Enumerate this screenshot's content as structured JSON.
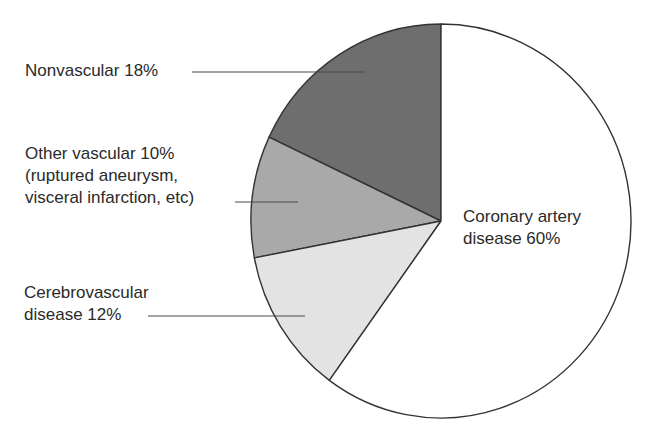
{
  "chart_data": {
    "type": "pie",
    "title": "",
    "start_angle_deg": 90,
    "direction": "counterclockwise",
    "slices": [
      {
        "label": "Nonvascular",
        "value": 18,
        "color": "#6e6e6e",
        "label_lines": [
          "Nonvascular 18%"
        ]
      },
      {
        "label": "Other vascular (ruptured aneurysm, visceral infarction, etc)",
        "value": 10,
        "color": "#a9a9a9",
        "label_lines": [
          "Other vascular 10%",
          "(ruptured aneurysm,",
          "visceral infarction, etc)"
        ]
      },
      {
        "label": "Cerebrovascular disease",
        "value": 12,
        "color": "#e3e3e3",
        "label_lines": [
          "Cerebrovascular",
          "disease 12%"
        ]
      },
      {
        "label": "Coronary artery disease",
        "value": 60,
        "color": "#ffffff",
        "label_lines": [
          "Coronary artery",
          "disease 60%"
        ]
      }
    ],
    "legend": "none (direct labels with leader lines)"
  },
  "labels": {
    "nonvascular": {
      "line1": "Nonvascular 18%"
    },
    "other_vascular": {
      "line1": "Other vascular 10%",
      "line2": "(ruptured aneurysm,",
      "line3": "visceral infarction, etc)"
    },
    "cerebrovascular": {
      "line1": "Cerebrovascular",
      "line2": "disease 12%"
    },
    "coronary": {
      "line1": "Coronary artery",
      "line2": "disease 60%"
    }
  }
}
